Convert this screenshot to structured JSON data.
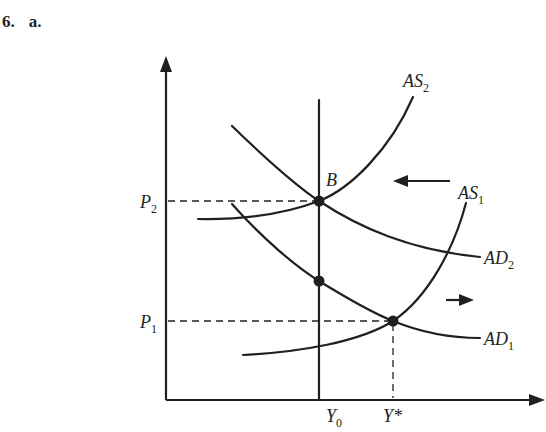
{
  "heading": {
    "number": "6.",
    "part": "a."
  },
  "diagram": {
    "type": "AD-AS shift diagram",
    "axes": {
      "y_axis": "price level (unlabeled)",
      "x_axis": "output (unlabeled)"
    },
    "labels": {
      "as2": "AS",
      "as2_sub": "2",
      "as1": "AS",
      "as1_sub": "1",
      "ad2": "AD",
      "ad2_sub": "2",
      "ad1": "AD",
      "ad1_sub": "1",
      "p2": "P",
      "p2_sub": "2",
      "p1": "P",
      "p1_sub": "1",
      "y0": "Y",
      "y0_sub": "0",
      "ystar": "Y*",
      "point_b": "B"
    },
    "curves": [
      {
        "name": "AS1",
        "kind": "upward-sloping supply",
        "position": "right/lower"
      },
      {
        "name": "AS2",
        "kind": "upward-sloping supply",
        "position": "left/upper"
      },
      {
        "name": "AD1",
        "kind": "downward-sloping demand",
        "position": "lower"
      },
      {
        "name": "AD2",
        "kind": "downward-sloping demand",
        "position": "upper"
      },
      {
        "name": "Y0",
        "kind": "vertical line (long-run output)"
      }
    ],
    "points": [
      {
        "label": "B",
        "at": "AS2 ∩ AD2 on Y0",
        "price": "P2"
      },
      {
        "label": "",
        "at": "AD1 on Y0"
      },
      {
        "label": "",
        "at": "AS1 ∩ AD1",
        "price": "P1",
        "output": "Y*"
      }
    ],
    "arrows": [
      {
        "direction": "left",
        "meaning": "AS shifts from AS1 to AS2"
      },
      {
        "direction": "right",
        "meaning": "AD shifts from AD1 to AD2"
      }
    ],
    "colors": {
      "ink": "#231f20",
      "background": "#ffffff"
    }
  }
}
